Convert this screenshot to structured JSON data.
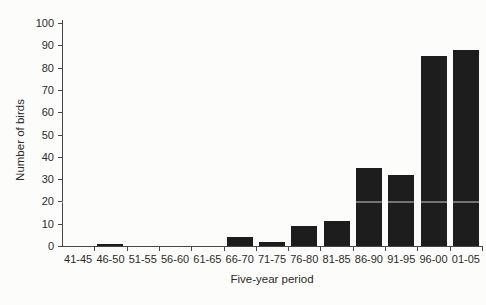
{
  "figure": {
    "background_color": "#fcfcfa",
    "bar_color": "#1d1d1d",
    "axis_color": "#474747",
    "text_color": "#2b2b2b"
  },
  "artifacts": {
    "white_scan_line_value": 20
  },
  "chart_data": {
    "type": "bar",
    "categories": [
      "41-45",
      "46-50",
      "51-55",
      "56-60",
      "61-65",
      "66-70",
      "71-75",
      "76-80",
      "81-85",
      "86-90",
      "91-95",
      "96-00",
      "01-05"
    ],
    "values": [
      0,
      1,
      0,
      0,
      0,
      4,
      2,
      9,
      11,
      35,
      32,
      85,
      88
    ],
    "title": "",
    "xlabel": "Five-year period",
    "ylabel": "Number of birds",
    "ylim": [
      0,
      100
    ],
    "yticks": [
      0,
      10,
      20,
      30,
      40,
      50,
      60,
      70,
      80,
      90,
      100
    ],
    "grid": false,
    "legend": null
  }
}
